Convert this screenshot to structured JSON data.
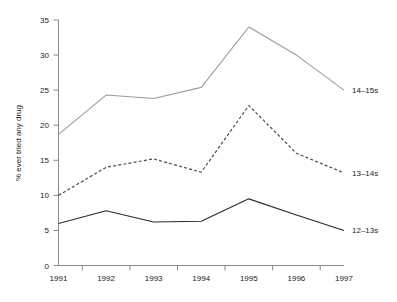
{
  "chart_data": {
    "type": "line",
    "title": "",
    "xlabel": "",
    "ylabel": "% ever tried any drug",
    "categories": [
      "1991",
      "1992",
      "1993",
      "1994",
      "1995",
      "1996",
      "1997"
    ],
    "x": [
      1991,
      1992,
      1993,
      1994,
      1995,
      1996,
      1997
    ],
    "ylim": [
      0,
      35
    ],
    "xlim": [
      1991,
      1997
    ],
    "yticks": [
      0,
      5,
      10,
      15,
      20,
      25,
      30,
      35
    ],
    "ytick_labels": [
      "0",
      "5",
      "10",
      "15",
      "20",
      "25",
      "30",
      "35"
    ],
    "xtick_labels": [
      "1991",
      "1992",
      "1993",
      "1994",
      "1995",
      "1996",
      "1997"
    ],
    "grid": false,
    "legend_position": "right-inline-labels",
    "series": [
      {
        "name": "14–15s",
        "label": "14–15s",
        "style": "solid",
        "color": "#9a9a9a",
        "values": [
          18.7,
          24.3,
          23.8,
          25.4,
          34.0,
          30.0,
          25.0
        ]
      },
      {
        "name": "13–14s",
        "label": "13–14s",
        "style": "dashed",
        "color": "#4a4a4a",
        "values": [
          10.0,
          14.0,
          15.2,
          13.3,
          22.8,
          16.0,
          13.2
        ]
      },
      {
        "name": "12–13s",
        "label": "12–13s",
        "style": "solid",
        "color": "#2a2a2a",
        "values": [
          6.0,
          7.8,
          6.2,
          6.3,
          9.5,
          7.2,
          5.0
        ]
      }
    ]
  },
  "axes": {
    "y_title": "% ever tried any drug"
  },
  "labels": {
    "series_14_15": "14–15s",
    "series_13_14": "13–14s",
    "series_12_13": "12–13s"
  }
}
